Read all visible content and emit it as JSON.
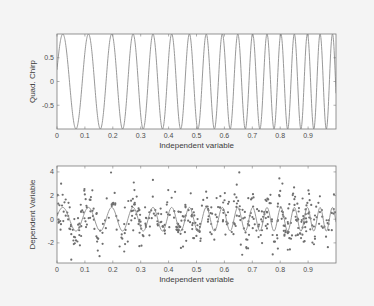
{
  "figure": {
    "background": "#f4f4f4",
    "axes_background": "#ffffff",
    "axes_color": "#7a7a7a",
    "line_color": "#8c8c8c",
    "marker_color": "#6e6e6e"
  },
  "chart_data": [
    {
      "type": "line",
      "title": "",
      "xlabel": "Independent variable",
      "ylabel": "Quad. Chirp",
      "xlim": [
        0,
        1
      ],
      "ylim": [
        -1,
        1
      ],
      "xticks": [
        0,
        0.1,
        0.2,
        0.3,
        0.4,
        0.5,
        0.6,
        0.7,
        0.8,
        0.9
      ],
      "xtick_labels": [
        "0",
        "0.1",
        "0.2",
        "0.3",
        "0.4",
        "0.5",
        "0.6",
        "0.7",
        "0.8",
        "0.9"
      ],
      "yticks": [
        -0.5,
        0,
        0.5
      ],
      "ytick_labels": [
        "-0.5",
        "0",
        "0.5"
      ],
      "grid": false,
      "series": [
        {
          "name": "quadratic chirp",
          "model": "y = sin(2*pi*(f0*t + 0.5*k*t^2) + phase)",
          "f0": 10,
          "k": 13,
          "phase": 0.25,
          "amplitude": 1,
          "samples": 1200
        }
      ],
      "box": {
        "left": 57,
        "top": 34,
        "right": 336,
        "bottom": 129
      }
    },
    {
      "type": "scatter",
      "title": "",
      "xlabel": "Independent variable",
      "ylabel": "Dependent Variable",
      "xlim": [
        0,
        1
      ],
      "ylim": [
        -3.7,
        4.5
      ],
      "xticks": [
        0,
        0.1,
        0.2,
        0.3,
        0.4,
        0.5,
        0.6,
        0.7,
        0.8,
        0.9
      ],
      "xtick_labels": [
        "0",
        "0.1",
        "0.2",
        "0.3",
        "0.4",
        "0.5",
        "0.6",
        "0.7",
        "0.8",
        "0.9"
      ],
      "yticks": [
        -2,
        0,
        2,
        4
      ],
      "ytick_labels": [
        "-2",
        "0",
        "2",
        "4"
      ],
      "grid": false,
      "series": [
        {
          "name": "noisy observations",
          "kind": "markers",
          "model": "y = sin(2*pi*(f0*t + 0.5*k*t^2) + phase) + noise",
          "f0": 10,
          "k": 13,
          "phase": 0.25,
          "noise_std": 1.0,
          "count": 500,
          "seed": 7
        },
        {
          "name": "fitted chirp",
          "kind": "line",
          "f0": 10,
          "k": 13,
          "phase": 0.25,
          "amplitude": 1,
          "samples": 400
        }
      ],
      "box": {
        "left": 57,
        "top": 166,
        "right": 336,
        "bottom": 263
      }
    }
  ]
}
